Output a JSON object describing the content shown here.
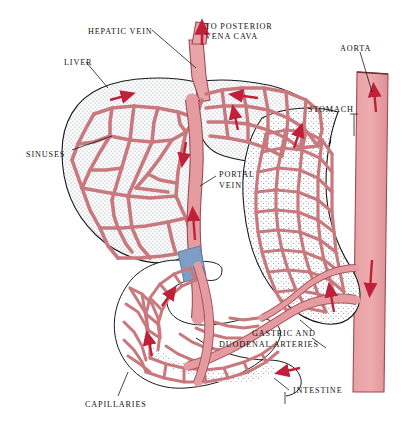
{
  "figure": {
    "background_color": "#ffffff"
  },
  "palette": {
    "vessel_fill": "#e8a4a6",
    "vessel_fill_light": "#eeb4b5",
    "vessel_outline": "#9e4a52",
    "arrow_red": "#c0203a",
    "tissue_stipple": "#8f9aa6",
    "organ_outline": "#1a1a1a",
    "portal_band_blue": "#7f9ec6",
    "label_text": "#15110f",
    "leader_line": "#1a1a1a"
  },
  "labels": [
    {
      "id": "hepatic-vein",
      "text": "HEPATIC VEIN",
      "x": 88,
      "y": 27,
      "align": "left"
    },
    {
      "id": "to-posterior-vena-cava-1",
      "text": "TO POSTERIOR",
      "x": 205,
      "y": 22,
      "align": "left"
    },
    {
      "id": "to-posterior-vena-cava-2",
      "text": "VENA CAVA",
      "x": 205,
      "y": 32,
      "align": "left"
    },
    {
      "id": "aorta",
      "text": "AORTA",
      "x": 340,
      "y": 44,
      "align": "left"
    },
    {
      "id": "liver",
      "text": "LIVER",
      "x": 64,
      "y": 58,
      "align": "left"
    },
    {
      "id": "stomach",
      "text": "STOMACH",
      "x": 308,
      "y": 105,
      "align": "left"
    },
    {
      "id": "sinuses",
      "text": "SINUSES",
      "x": 26,
      "y": 150,
      "align": "left"
    },
    {
      "id": "portal-vein-1",
      "text": "PORTAL",
      "x": 219,
      "y": 170,
      "align": "left"
    },
    {
      "id": "portal-vein-2",
      "text": "VEIN",
      "x": 219,
      "y": 181,
      "align": "left"
    },
    {
      "id": "gastric-and",
      "text": "GASTRIC AND",
      "x": 252,
      "y": 329,
      "align": "left"
    },
    {
      "id": "duodenal-arteries",
      "text": "DUODENAL ARTERIES",
      "x": 219,
      "y": 340,
      "align": "left"
    },
    {
      "id": "intestine",
      "text": "INTESTINE",
      "x": 293,
      "y": 386,
      "align": "left"
    },
    {
      "id": "capillaries",
      "text": "CAPILLARIES",
      "x": 85,
      "y": 400,
      "align": "left"
    }
  ],
  "anatomy": {
    "organs": [
      {
        "name": "liver",
        "label": "LIVER"
      },
      {
        "name": "stomach",
        "label": "STOMACH"
      },
      {
        "name": "intestine",
        "label": "INTESTINE"
      },
      {
        "name": "aorta",
        "label": "AORTA"
      }
    ],
    "vessels": [
      {
        "name": "hepatic-vein",
        "label": "HEPATIC VEIN",
        "flow": "out-of-liver"
      },
      {
        "name": "vena-cava",
        "label": "TO POSTERIOR VENA CAVA",
        "flow": "upward"
      },
      {
        "name": "portal-vein",
        "label": "PORTAL VEIN",
        "flow": "into-liver"
      },
      {
        "name": "gastric-duodenal",
        "label": "GASTRIC AND DUODENAL ARTERIES",
        "flow": "from-aorta"
      },
      {
        "name": "sinuses",
        "label": "SINUSES",
        "flow": "liver-network"
      },
      {
        "name": "capillaries",
        "label": "CAPILLARIES",
        "flow": "intestinal-network"
      }
    ]
  }
}
